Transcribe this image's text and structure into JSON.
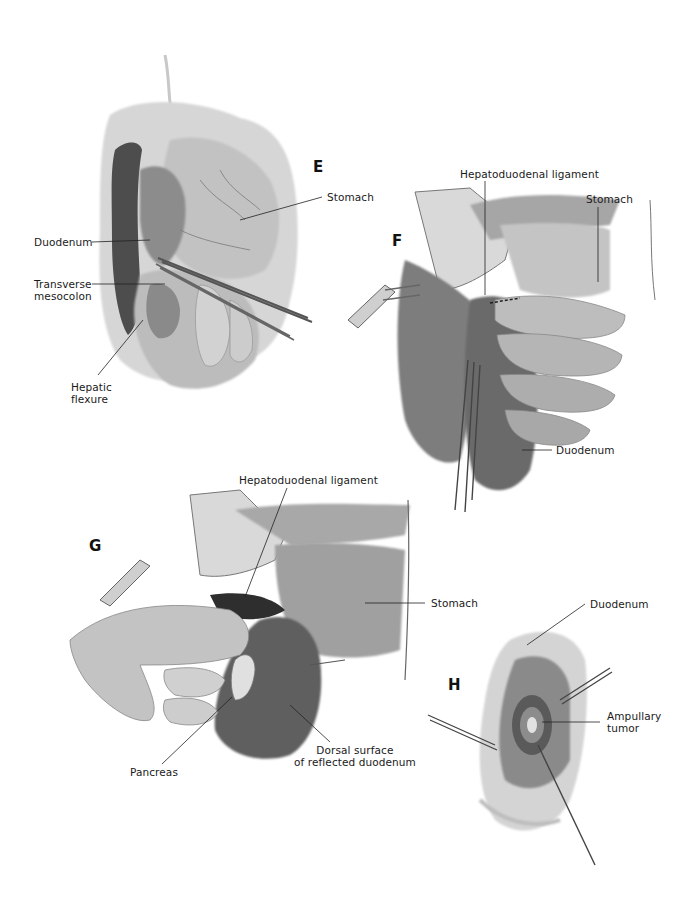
{
  "figure": {
    "panels": [
      {
        "id": "E",
        "letter": "E",
        "labels": {
          "stomach": "Stomach",
          "duodenum": "Duodenum",
          "transverse_mesocolon": "Transverse\nmesocolon",
          "hepatic_flexure": "Hepatic\nflexure"
        }
      },
      {
        "id": "F",
        "letter": "F",
        "labels": {
          "hepatoduodenal_ligament": "Hepatoduodenal ligament",
          "stomach": "Stomach",
          "duodenum": "Duodenum"
        }
      },
      {
        "id": "G",
        "letter": "G",
        "labels": {
          "hepatoduodenal_ligament": "Hepatoduodenal ligament",
          "stomach": "Stomach",
          "pancreas": "Pancreas",
          "dorsal_surface": "Dorsal surface\nof reflected duodenum"
        }
      },
      {
        "id": "H",
        "letter": "H",
        "labels": {
          "duodenum": "Duodenum",
          "ampullary_tumor": "Ampullary\ntumor"
        }
      }
    ],
    "colors": {
      "background": "#ffffff",
      "ink": "#1a1a1a",
      "tissue_light": "#cfcfcf",
      "tissue_mid": "#9a9a9a",
      "tissue_dark": "#4a4a4a"
    }
  }
}
